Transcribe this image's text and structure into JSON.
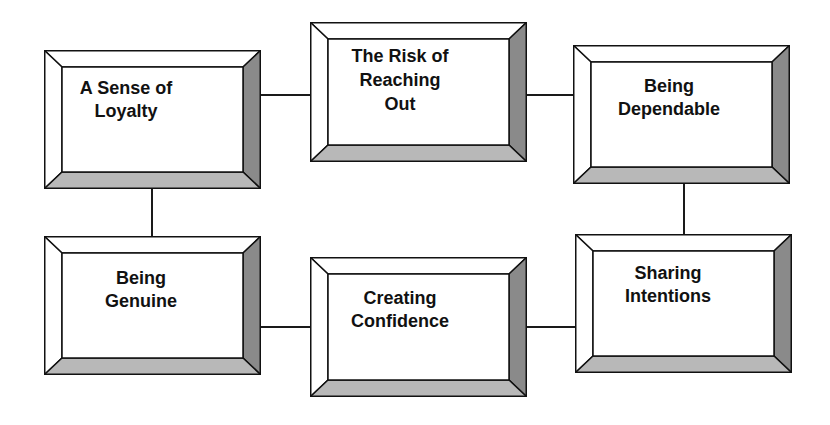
{
  "diagram": {
    "type": "bevelled-box-flow",
    "colors": {
      "background": "#ffffff",
      "face": "#ffffff",
      "bevel_top": "#ffffff",
      "bevel_left": "#ffffff",
      "bevel_right": "#8a8a8a",
      "bevel_bottom": "#b8b8b8",
      "outline": "#111111",
      "text": "#111111"
    },
    "nodes": [
      {
        "id": "loyalty",
        "label": "A Sense of\nLoyalty"
      },
      {
        "id": "risk",
        "label": "The Risk of\nReaching\nOut"
      },
      {
        "id": "dependable",
        "label": "Being\nDependable"
      },
      {
        "id": "genuine",
        "label": "Being\nGenuine"
      },
      {
        "id": "confidence",
        "label": "Creating\nConfidence"
      },
      {
        "id": "intentions",
        "label": "Sharing\nIntentions"
      }
    ],
    "edges": [
      {
        "from": "loyalty",
        "to": "risk"
      },
      {
        "from": "risk",
        "to": "dependable"
      },
      {
        "from": "dependable",
        "to": "intentions"
      },
      {
        "from": "intentions",
        "to": "confidence"
      },
      {
        "from": "confidence",
        "to": "genuine"
      },
      {
        "from": "genuine",
        "to": "loyalty"
      }
    ]
  }
}
